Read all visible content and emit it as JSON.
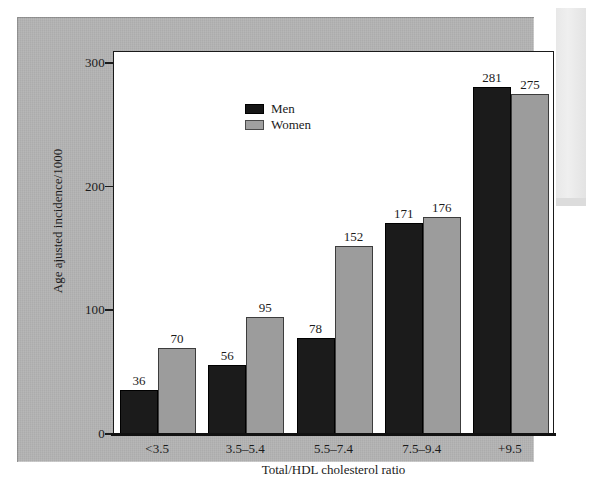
{
  "figure": {
    "background_color": "#b4b4b4",
    "plot_background_color": "#ffffff"
  },
  "chart_data": {
    "type": "bar",
    "title": "",
    "subtitle": "",
    "xlabel": "Total/HDL cholesterol ratio",
    "ylabel": "Age ajusted incidence/1000",
    "categories": [
      "<3.5",
      "3.5–5.4",
      "5.5–7.4",
      "7.5–9.4",
      "+9.5"
    ],
    "series": [
      {
        "name": "Men",
        "color": "#1b1b1b",
        "values": [
          36,
          56,
          78,
          171,
          281
        ]
      },
      {
        "name": "Women",
        "color": "#9c9c9c",
        "values": [
          70,
          95,
          152,
          176,
          275
        ]
      }
    ],
    "ylim": [
      0,
      310
    ],
    "yticks": [
      0,
      100,
      200,
      300
    ],
    "ytick_labels": [
      "0",
      "100",
      "200",
      "300"
    ],
    "grid": false,
    "legend_position": "top-left",
    "data_labels": true
  },
  "legend": {
    "entries": [
      {
        "label": "Men",
        "swatch": "men-swatch"
      },
      {
        "label": "Women",
        "swatch": "women-swatch"
      }
    ]
  }
}
